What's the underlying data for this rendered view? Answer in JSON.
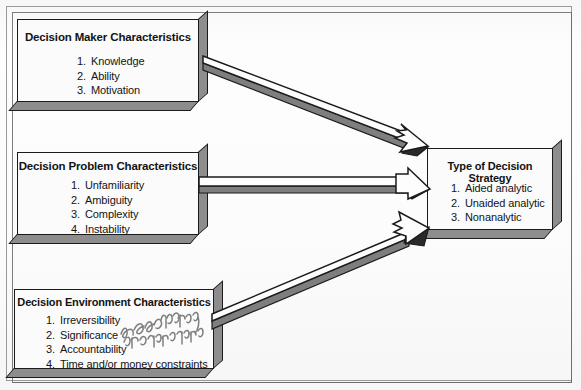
{
  "figure": {
    "background_color": "#fcfcfc",
    "ink_color": "#131313",
    "shadow_color": "#8d8d8d"
  },
  "boxes": {
    "decision_maker": {
      "title": "Decision Maker Characteristics",
      "items": [
        {
          "num": "1.",
          "label": "Knowledge"
        },
        {
          "num": "2.",
          "label": "Ability"
        },
        {
          "num": "3.",
          "label": "Motivation"
        }
      ]
    },
    "decision_problem": {
      "title": "Decision Problem Characteristics",
      "items": [
        {
          "num": "1.",
          "label": "Unfamiliarity"
        },
        {
          "num": "2.",
          "label": "Ambiguity"
        },
        {
          "num": "3.",
          "label": "Complexity"
        },
        {
          "num": "4.",
          "label": "Instability"
        }
      ]
    },
    "decision_environment": {
      "title": "Decision Environment Characteristics",
      "items": [
        {
          "num": "1.",
          "label": "Irreversibility"
        },
        {
          "num": "2.",
          "label": "Significance"
        },
        {
          "num": "3.",
          "label": "Accountability"
        },
        {
          "num": "4.",
          "label": "Time and/or money constraints"
        }
      ]
    },
    "decision_strategy": {
      "title": "Type of Decision Strategy",
      "items": [
        {
          "num": "1.",
          "label": "Aided analytic"
        },
        {
          "num": "2.",
          "label": "Unaided analytic"
        },
        {
          "num": "3.",
          "label": "Nonanalytic"
        }
      ]
    }
  },
  "arrows": [
    {
      "id": "arrow-maker-to-strategy",
      "from": "decision_maker",
      "to": "decision_strategy"
    },
    {
      "id": "arrow-problem-to-strategy",
      "from": "decision_problem",
      "to": "decision_strategy"
    },
    {
      "id": "arrow-environment-to-strategy",
      "from": "decision_environment",
      "to": "decision_strategy"
    }
  ],
  "annotation": {
    "kind": "handwritten-pencil-scribble",
    "legible": false,
    "text": ""
  }
}
